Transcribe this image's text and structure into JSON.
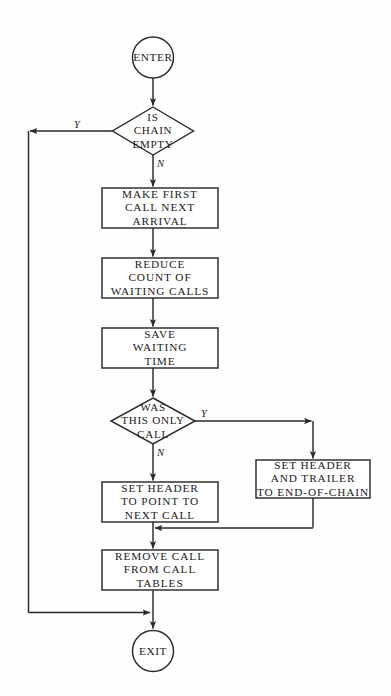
{
  "diagram": {
    "type": "flowchart",
    "colors": {
      "background": "#fefefe",
      "stroke": "#2a2a2a",
      "text": "#1a1a1a"
    },
    "nodes": [
      {
        "id": "enter",
        "shape": "circle",
        "lines": [
          "ENTER"
        ]
      },
      {
        "id": "is-chain-empty",
        "shape": "diamond",
        "lines": [
          "IS",
          "CHAIN",
          "EMPTY"
        ]
      },
      {
        "id": "make-first-call",
        "shape": "rect",
        "lines": [
          "MAKE FIRST",
          "CALL NEXT",
          "ARRIVAL"
        ]
      },
      {
        "id": "reduce-count",
        "shape": "rect",
        "lines": [
          "REDUCE",
          "COUNT OF",
          "WAITING CALLS"
        ]
      },
      {
        "id": "save-waiting-time",
        "shape": "rect",
        "lines": [
          "SAVE",
          "WAITING",
          "TIME"
        ]
      },
      {
        "id": "was-this-only-call",
        "shape": "diamond",
        "lines": [
          "WAS",
          "THIS ONLY",
          "CALL"
        ]
      },
      {
        "id": "set-header-trailer",
        "shape": "rect",
        "lines": [
          "SET HEADER",
          "AND TRAILER",
          "TO END-OF-CHAIN"
        ]
      },
      {
        "id": "set-header-point",
        "shape": "rect",
        "lines": [
          "SET HEADER",
          "TO POINT TO",
          "NEXT CALL"
        ]
      },
      {
        "id": "remove-call",
        "shape": "rect",
        "lines": [
          "REMOVE CALL",
          "FROM CALL",
          "TABLES"
        ]
      },
      {
        "id": "exit",
        "shape": "circle",
        "lines": [
          "EXIT"
        ]
      }
    ],
    "branch_labels": {
      "chain_empty_yes": "Y",
      "chain_empty_no": "N",
      "only_call_yes": "Y",
      "only_call_no": "N"
    }
  }
}
